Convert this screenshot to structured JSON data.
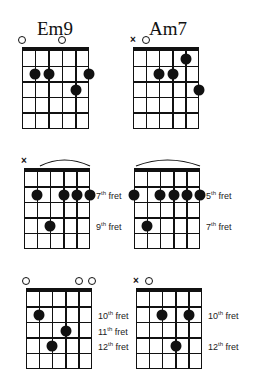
{
  "chords": [
    {
      "name": "Em9",
      "grid": {
        "x": 22,
        "y": 47,
        "w": 67,
        "h": 82
      },
      "strings": 6,
      "frets": 5,
      "title_pos": {
        "x": 37,
        "y": 18
      },
      "markers": [
        "open",
        "none",
        "none",
        "open",
        "none",
        "none"
      ],
      "dots": [
        {
          "string": 2,
          "fret": 2
        },
        {
          "string": 3,
          "fret": 2
        },
        {
          "string": 5,
          "fret": 3
        },
        {
          "string": 6,
          "fret": 2
        }
      ],
      "barre_arc": false,
      "fret_labels": []
    },
    {
      "name": "Am7",
      "grid": {
        "x": 133,
        "y": 47,
        "w": 66,
        "h": 82
      },
      "strings": 6,
      "frets": 5,
      "title_pos": {
        "x": 149,
        "y": 18
      },
      "markers": [
        "mute",
        "open",
        "none",
        "none",
        "none",
        "none"
      ],
      "dots": [
        {
          "string": 3,
          "fret": 2
        },
        {
          "string": 4,
          "fret": 2
        },
        {
          "string": 5,
          "fret": 1
        },
        {
          "string": 6,
          "fret": 3
        }
      ],
      "barre_arc": false,
      "fret_labels": []
    },
    {
      "name": "",
      "grid": {
        "x": 24,
        "y": 168,
        "w": 66,
        "h": 81
      },
      "strings": 6,
      "frets": 5,
      "markers": [
        "mute",
        "none",
        "none",
        "none",
        "none",
        "none"
      ],
      "dots": [
        {
          "string": 2,
          "fret": 2
        },
        {
          "string": 4,
          "fret": 2
        },
        {
          "string": 5,
          "fret": 2
        },
        {
          "string": 6,
          "fret": 2
        },
        {
          "string": 3,
          "fret": 4
        }
      ],
      "barre_arc": true,
      "fret_labels": [
        {
          "fret": 2,
          "num": "7",
          "suffix": "th",
          "word": "fret"
        },
        {
          "fret": 4,
          "num": "9",
          "suffix": "th",
          "word": "fret"
        }
      ]
    },
    {
      "name": "",
      "grid": {
        "x": 134,
        "y": 168,
        "w": 66,
        "h": 81
      },
      "strings": 6,
      "frets": 5,
      "markers": [
        "none",
        "none",
        "none",
        "none",
        "none",
        "none"
      ],
      "dots": [
        {
          "string": 1,
          "fret": 2
        },
        {
          "string": 3,
          "fret": 2
        },
        {
          "string": 4,
          "fret": 2
        },
        {
          "string": 5,
          "fret": 2
        },
        {
          "string": 6,
          "fret": 2
        },
        {
          "string": 2,
          "fret": 4
        }
      ],
      "barre_arc": true,
      "fret_labels": [
        {
          "fret": 2,
          "num": "5",
          "suffix": "th",
          "word": "fret"
        },
        {
          "fret": 4,
          "num": "7",
          "suffix": "th",
          "word": "fret"
        }
      ]
    },
    {
      "name": "",
      "grid": {
        "x": 26,
        "y": 288,
        "w": 66,
        "h": 81
      },
      "strings": 6,
      "frets": 5,
      "markers": [
        "open",
        "none",
        "none",
        "none",
        "open",
        "open"
      ],
      "dots": [
        {
          "string": 2,
          "fret": 2
        },
        {
          "string": 4,
          "fret": 3
        },
        {
          "string": 3,
          "fret": 4
        }
      ],
      "barre_arc": false,
      "fret_labels": [
        {
          "fret": 2,
          "num": "10",
          "suffix": "th",
          "word": "fret"
        },
        {
          "fret": 3,
          "num": "11",
          "suffix": "th",
          "word": "fret"
        },
        {
          "fret": 4,
          "num": "12",
          "suffix": "th",
          "word": "fret"
        }
      ]
    },
    {
      "name": "",
      "grid": {
        "x": 136,
        "y": 288,
        "w": 66,
        "h": 81
      },
      "strings": 6,
      "frets": 5,
      "markers": [
        "mute",
        "open",
        "none",
        "none",
        "none",
        "none"
      ],
      "dots": [
        {
          "string": 3,
          "fret": 2
        },
        {
          "string": 5,
          "fret": 2
        },
        {
          "string": 4,
          "fret": 4
        }
      ],
      "barre_arc": false,
      "fret_labels": [
        {
          "fret": 2,
          "num": "10",
          "suffix": "th",
          "word": "fret"
        },
        {
          "fret": 4,
          "num": "12",
          "suffix": "th",
          "word": "fret"
        }
      ]
    }
  ]
}
